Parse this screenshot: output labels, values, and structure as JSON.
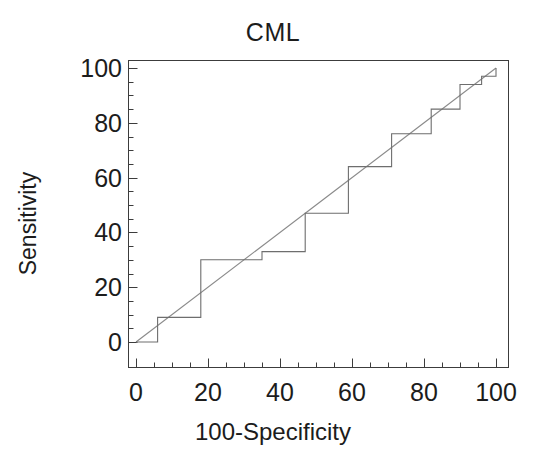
{
  "chart_data": {
    "type": "line",
    "title": "CML",
    "xlabel": "100-Specificity",
    "ylabel": "Sensitivity",
    "xlim": [
      0,
      100
    ],
    "ylim": [
      0,
      100
    ],
    "grid": false,
    "legend": "none",
    "axis_color": "#3c3c3c",
    "curve_color": "#6e6e6e",
    "reference_color": "#8a8a8a",
    "xticks_major": [
      0,
      20,
      40,
      60,
      80,
      100
    ],
    "xtick_labels": [
      "0",
      "20",
      "40",
      "60",
      "80",
      "100"
    ],
    "yticks_major": [
      0,
      20,
      40,
      60,
      80,
      100
    ],
    "ytick_labels": [
      "0",
      "20",
      "40",
      "60",
      "80",
      "100"
    ],
    "xticks_minor": [
      5,
      10,
      15,
      25,
      30,
      35,
      45,
      50,
      55,
      65,
      70,
      75,
      85,
      90,
      95
    ],
    "yticks_minor": [
      5,
      10,
      15,
      25,
      30,
      35,
      45,
      50,
      55,
      65,
      70,
      75,
      85,
      90,
      95
    ],
    "series": [
      {
        "name": "ROC curve",
        "style": "step",
        "x": [
          0,
          6,
          6,
          18,
          18,
          35,
          35,
          47,
          47,
          59,
          59,
          71,
          71,
          82,
          82,
          90,
          90,
          96,
          96,
          100,
          100
        ],
        "y": [
          0,
          0,
          9,
          9,
          30,
          30,
          33,
          33,
          47,
          47,
          64,
          64,
          76,
          76,
          85,
          85,
          94,
          94,
          97,
          97,
          100
        ]
      },
      {
        "name": "Reference line",
        "style": "line",
        "x": [
          0,
          100
        ],
        "y": [
          0,
          100
        ]
      }
    ]
  }
}
